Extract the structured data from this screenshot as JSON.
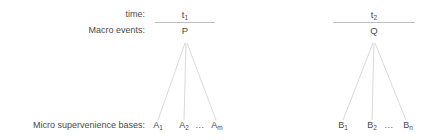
{
  "diagram": {
    "background_color": "#ffffff",
    "text_color": "#4a4a4a",
    "rule_color": "#bdbdbd",
    "line_color": "#c9c9c9",
    "row_labels": {
      "time": "time:",
      "macro": "Macro events:",
      "micro": "Micro supervenience bases:"
    },
    "columns": [
      {
        "id": "t1",
        "time_label": "t",
        "time_subscript": "1",
        "macro_event": "P",
        "leaves": [
          {
            "base": "A",
            "subscript": "1"
          },
          {
            "base": "A",
            "subscript": "2"
          },
          {
            "base": "A",
            "subscript": "m"
          }
        ],
        "ellipsis": "..."
      },
      {
        "id": "t2",
        "time_label": "t",
        "time_subscript": "2",
        "macro_event": "Q",
        "leaves": [
          {
            "base": "B",
            "subscript": "1"
          },
          {
            "base": "B",
            "subscript": "2"
          },
          {
            "base": "B",
            "subscript": "n"
          }
        ],
        "ellipsis": "..."
      }
    ]
  }
}
